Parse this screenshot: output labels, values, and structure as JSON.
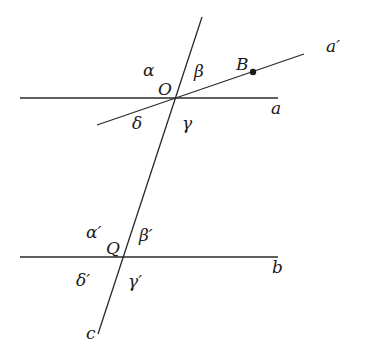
{
  "diagram": {
    "title": "",
    "colors": {
      "line": "#2a2a2a",
      "text": "#1a1a1a",
      "background": "#ffffff"
    },
    "lines": [
      {
        "id": "a",
        "label": "a",
        "x1": 20,
        "y1": 98,
        "x2": 278,
        "y2": 98,
        "label_x": 271,
        "label_y": 100
      },
      {
        "id": "a_prime",
        "label": "a′",
        "x1": 97,
        "y1": 125,
        "x2": 304,
        "y2": 54,
        "label_x": 326,
        "label_y": 38
      },
      {
        "id": "b",
        "label": "b",
        "x1": 20,
        "y1": 257,
        "x2": 278,
        "y2": 257,
        "label_x": 272,
        "label_y": 259
      },
      {
        "id": "c",
        "label": "c",
        "x1": 202,
        "y1": 17,
        "x2": 98,
        "y2": 334,
        "label_x": 86,
        "label_y": 325
      }
    ],
    "points": [
      {
        "id": "O",
        "label": "O",
        "x": 175,
        "y": 98,
        "dot": false,
        "label_x": 158,
        "label_y": 81
      },
      {
        "id": "B",
        "label": "B",
        "x": 253,
        "y": 72,
        "dot": true,
        "label_x": 236,
        "label_y": 56
      },
      {
        "id": "Q",
        "label": "Q",
        "x": 123,
        "y": 257,
        "dot": false,
        "label_x": 106,
        "label_y": 240
      }
    ],
    "angles": [
      {
        "id": "alpha",
        "label": "α",
        "x": 143,
        "y": 62
      },
      {
        "id": "beta",
        "label": "β",
        "x": 194,
        "y": 63
      },
      {
        "id": "delta",
        "label": "δ",
        "x": 132,
        "y": 115
      },
      {
        "id": "gamma",
        "label": "γ",
        "x": 182,
        "y": 115
      },
      {
        "id": "alpha_prime",
        "label": "α′",
        "x": 86,
        "y": 224
      },
      {
        "id": "beta_prime",
        "label": "β′",
        "x": 139,
        "y": 227
      },
      {
        "id": "delta_prime",
        "label": "δ′",
        "x": 76,
        "y": 272
      },
      {
        "id": "gamma_prime",
        "label": "γ′",
        "x": 128,
        "y": 273
      }
    ]
  }
}
